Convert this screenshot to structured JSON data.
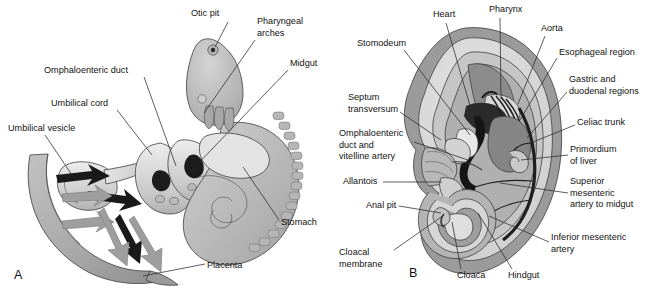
{
  "figure": {
    "background": "#ffffff",
    "width": 655,
    "height": 289
  },
  "palette": {
    "ink": "#111111",
    "leader": "#2a2a2a",
    "outline": "#3d3d3d",
    "amnion_outer": "#9a9a9a",
    "chorion_band": "#8f8f8f",
    "cavity_light": "#dcdcdc",
    "body_light": "#c9c9c9",
    "body_mid": "#b2b2b2",
    "body_dark": "#8b8b8b",
    "gut_dark": "#6e6e6e",
    "vessel_black": "#1c1c1c",
    "highlight": "#eeeeee",
    "placenta_gray": "#a8a8a8",
    "arrow_gray": "#9e9e9e",
    "white": "#ffffff"
  },
  "panels": [
    {
      "id": "A",
      "letter": "A",
      "letter_x": 14,
      "letter_y": 279,
      "caption": "Sagittal view of embryo with umbilical vesicle, umbilical cord and placenta"
    },
    {
      "id": "B",
      "letter": "B",
      "letter_x": 409,
      "letter_y": 277,
      "caption": "Median section of embryo showing primordial gut and its arteries"
    }
  ],
  "labels_panel_a": [
    {
      "name": "otic-pit",
      "text": [
        "Otic pit"
      ],
      "x": 191,
      "y": 14,
      "anchor": "start",
      "leader": "M 228 22 L 215 47"
    },
    {
      "name": "pharyngeal-arches",
      "text": [
        "Pharyngeal",
        "arches"
      ],
      "x": 257,
      "y": 22,
      "anchor": "start",
      "leader": "M 255 40 L 204 113"
    },
    {
      "name": "midgut",
      "text": [
        "Midgut"
      ],
      "x": 290,
      "y": 64,
      "anchor": "start",
      "leader": "M 288 70 L 190 172"
    },
    {
      "name": "omphaloenteric-duct",
      "text": [
        "Omphaloenteric duct"
      ],
      "x": 44,
      "y": 71,
      "anchor": "start",
      "leader": "M 144 77 L 176 166"
    },
    {
      "name": "umbilical-cord",
      "text": [
        "Umbilical cord"
      ],
      "x": 51,
      "y": 104,
      "anchor": "start",
      "leader": "M 117 110 L 152 155"
    },
    {
      "name": "umbilical-vesicle",
      "text": [
        "Umbilical vesicle"
      ],
      "x": 8,
      "y": 129,
      "anchor": "start",
      "leader": "M 45 135 L 74 178"
    },
    {
      "name": "stomach",
      "text": [
        "Stomach"
      ],
      "x": 281,
      "y": 223,
      "anchor": "start",
      "leader": "M 279 220 L 243 167"
    },
    {
      "name": "placenta",
      "text": [
        "Placenta"
      ],
      "x": 207,
      "y": 266,
      "anchor": "start",
      "leader": "M 205 264 L 143 276"
    }
  ],
  "labels_panel_b": [
    {
      "name": "heart",
      "text": [
        "Heart"
      ],
      "x": 433,
      "y": 15,
      "anchor": "start",
      "leader": "M 446 23 L 473 116"
    },
    {
      "name": "pharynx",
      "text": [
        "Pharynx"
      ],
      "x": 489,
      "y": 10,
      "anchor": "start",
      "leader": "M 500 18 L 501 99"
    },
    {
      "name": "aorta",
      "text": [
        "Aorta"
      ],
      "x": 541,
      "y": 29,
      "anchor": "start",
      "leader": "M 545 36 L 518 104"
    },
    {
      "name": "stomodeum",
      "text": [
        "Stomodeum"
      ],
      "x": 357,
      "y": 44,
      "anchor": "start",
      "leader": "M 404 50 L 470 135"
    },
    {
      "name": "esophageal-region",
      "text": [
        "Esophageal region"
      ],
      "x": 559,
      "y": 53,
      "anchor": "start",
      "leader": "M 557 58 L 520 120"
    },
    {
      "name": "gastric-duodenal-regions",
      "text": [
        "Gastric and",
        "duodenal regions"
      ],
      "x": 569,
      "y": 80,
      "anchor": "start",
      "leader": "M 567 92 L 527 138"
    },
    {
      "name": "septum-transversum",
      "text": [
        "Septum",
        "transversum"
      ],
      "x": 348,
      "y": 98,
      "anchor": "start",
      "leader": "M 400 112 L 441 140"
    },
    {
      "name": "celiac-trunk",
      "text": [
        "Celiac trunk"
      ],
      "x": 577,
      "y": 123,
      "anchor": "start",
      "leader": "M 575 125 L 533 142"
    },
    {
      "name": "omphaloenteric-duct-vitelline-artery",
      "text": [
        "Omphaloenteric",
        "duct and",
        "vitelline artery"
      ],
      "x": 339,
      "y": 134,
      "anchor": "start",
      "leader": "M 414 142 L 468 160"
    },
    {
      "name": "primordium-of-liver",
      "text": [
        "Primordium",
        "of liver"
      ],
      "x": 570,
      "y": 150,
      "anchor": "start",
      "leader": "M 568 155 L 521 160"
    },
    {
      "name": "allantois",
      "text": [
        "Allantois"
      ],
      "x": 343,
      "y": 182,
      "anchor": "start",
      "leader": "M 383 182 L 442 182"
    },
    {
      "name": "superior-mesenteric-artery",
      "text": [
        "Superior",
        "mesenteric",
        "artery to midgut"
      ],
      "x": 570,
      "y": 182,
      "anchor": "start",
      "leader": "M 568 193 L 500 183"
    },
    {
      "name": "anal-pit",
      "text": [
        "Anal pit"
      ],
      "x": 366,
      "y": 206,
      "anchor": "start",
      "leader": "M 399 206 L 441 213"
    },
    {
      "name": "inferior-mesenteric-artery",
      "text": [
        "Inferior mesenteric",
        "artery"
      ],
      "x": 551,
      "y": 238,
      "anchor": "start",
      "leader": "M 549 242 L 489 216"
    },
    {
      "name": "cloacal-membrane",
      "text": [
        "Cloacal",
        "membrane"
      ],
      "x": 339,
      "y": 253,
      "anchor": "start",
      "leader": "M 394 250 L 444 215"
    },
    {
      "name": "cloaca",
      "text": [
        "Cloaca"
      ],
      "x": 457,
      "y": 276,
      "anchor": "start",
      "leader": "M 461 269 L 452 222"
    },
    {
      "name": "hindgut",
      "text": [
        "Hindgut"
      ],
      "x": 508,
      "y": 276,
      "anchor": "start",
      "leader": "M 512 269 L 478 213"
    }
  ]
}
